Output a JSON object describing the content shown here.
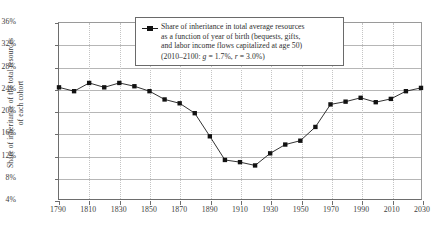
{
  "chart_data": {
    "type": "line",
    "title": "",
    "xlabel": "",
    "ylabel": "Share of inheritance of the total resources of each cohort",
    "ylabel_line1": "Share of inheritance of the total resources",
    "ylabel_line2": "of each cohort",
    "ylim": [
      4,
      36
    ],
    "xlim": [
      1790,
      2030
    ],
    "grid": true,
    "legend_position": "top-center",
    "ytick_labels": [
      "36%",
      "32%",
      "28%",
      "24%",
      "20%",
      "16%",
      "12%",
      "8%",
      "4%"
    ],
    "ytick_values": [
      36,
      32,
      28,
      24,
      20,
      16,
      12,
      8,
      4
    ],
    "xtick_labels": [
      "1790",
      "1810",
      "1830",
      "1850",
      "1870",
      "1890",
      "1910",
      "1930",
      "1950",
      "1970",
      "1990",
      "2010",
      "2030"
    ],
    "xtick_values": [
      1790,
      1810,
      1830,
      1850,
      1870,
      1890,
      1910,
      1930,
      1950,
      1970,
      1990,
      2010,
      2030
    ],
    "series": [
      {
        "name": "Share of inheritance in total average resources",
        "color": "#121212",
        "marker": "square",
        "x": [
          1790,
          1800,
          1810,
          1820,
          1830,
          1840,
          1850,
          1860,
          1870,
          1880,
          1890,
          1900,
          1910,
          1920,
          1930,
          1940,
          1950,
          1960,
          1970,
          1980,
          1990,
          2000,
          2010,
          2020,
          2030
        ],
        "values": [
          24.3,
          23.6,
          25.1,
          24.3,
          25.1,
          24.5,
          23.6,
          22.1,
          21.4,
          19.6,
          15.4,
          11.1,
          10.7,
          10.1,
          12.3,
          13.9,
          14.6,
          17.1,
          21.2,
          21.7,
          22.4,
          21.6,
          22.2,
          23.6,
          24.2
        ]
      }
    ],
    "legend": {
      "line1": "Share of inheritance in total average resources",
      "line2": "as a function of year of birth (bequests, gifts,",
      "line3": "and labor income flows capitalized at age 50)",
      "line4_pre": "(2010–2100: ",
      "line4_g": "g",
      "line4_mid": " = 1.7%, ",
      "line4_r": "r",
      "line4_post": " = 3.0%)"
    }
  }
}
